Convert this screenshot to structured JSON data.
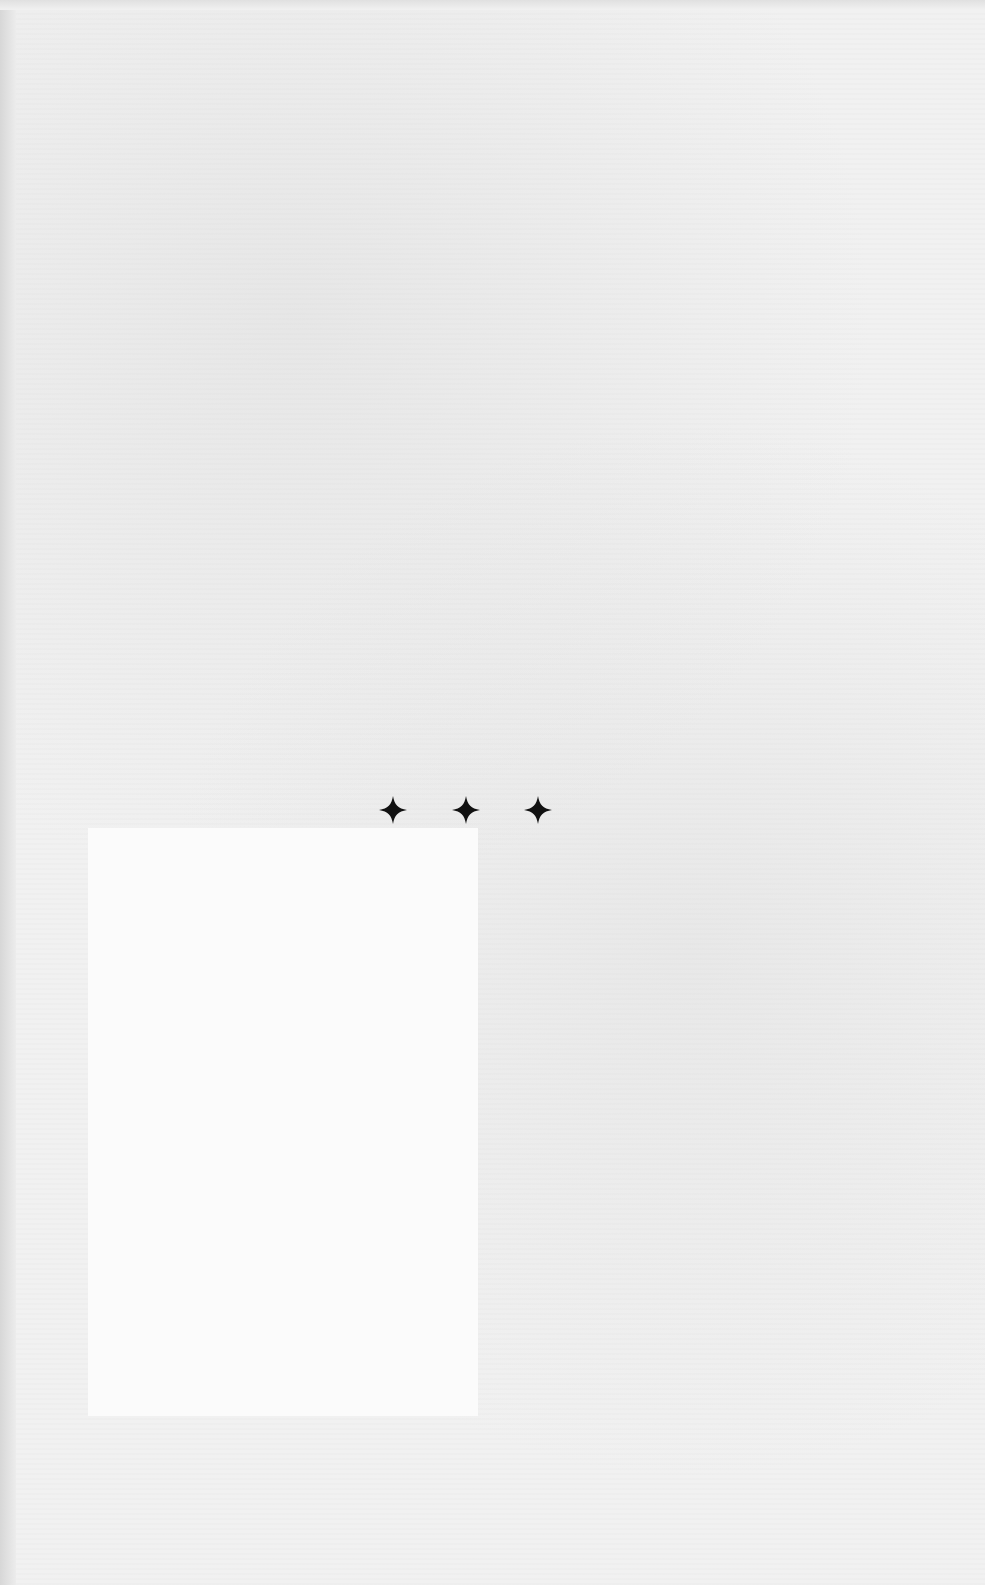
{
  "page": {
    "type": "blank scanned book page",
    "ornament": {
      "icon": "four-point-star-ornament",
      "count": 3,
      "color": "#111111"
    }
  }
}
